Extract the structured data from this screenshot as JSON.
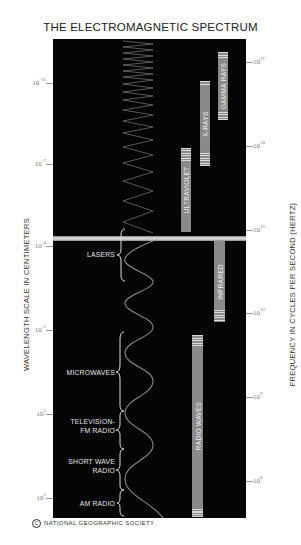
{
  "title": "THE ELECTROMAGNETIC SPECTRUM",
  "axes": {
    "left_label": "WAVELENGTH SCALE IN CENTIMETERS",
    "right_label": "FREQUENCY IN CYCLES PER SECOND (HERTZ)",
    "left_ticks": [
      {
        "base": "10",
        "exp": "-10"
      },
      {
        "base": "10",
        "exp": "-7"
      },
      {
        "base": "10",
        "exp": "-4"
      },
      {
        "base": "10",
        "exp": "-1"
      },
      {
        "base": "10",
        "exp": "2"
      },
      {
        "base": "10",
        "exp": "5"
      }
    ],
    "right_ticks": [
      {
        "base": "10",
        "exp": "21"
      },
      {
        "base": "10",
        "exp": "18"
      },
      {
        "base": "10",
        "exp": "15"
      },
      {
        "base": "10",
        "exp": "12"
      },
      {
        "base": "10",
        "exp": "9"
      },
      {
        "base": "10",
        "exp": "6"
      }
    ]
  },
  "bands": [
    {
      "name": "GAMMA RAYS"
    },
    {
      "name": "X-RAYS"
    },
    {
      "name": "ULTRAVIOLET"
    },
    {
      "name": "INFRARED"
    },
    {
      "name": "RADIO WAVES"
    }
  ],
  "applications": [
    {
      "line1": "LASERS",
      "line2": ""
    },
    {
      "line1": "MICROWAVES",
      "line2": ""
    },
    {
      "line1": "TELEVISION-",
      "line2": "FM RADIO"
    },
    {
      "line1": "SHORT WAVE",
      "line2": "RADIO"
    },
    {
      "line1": "AM RADIO",
      "line2": ""
    }
  ],
  "footer": {
    "symbol": "C",
    "text": "NATIONAL GEOGRAPHIC SOCIETY"
  },
  "colors": {
    "panel": "#050505",
    "bar": "#8a8a8a",
    "visible_band": "#d8d8d8"
  }
}
